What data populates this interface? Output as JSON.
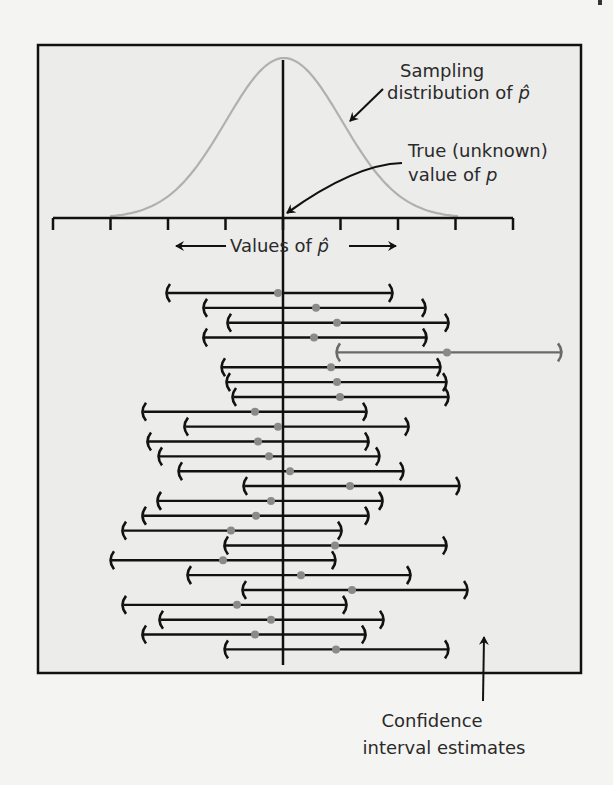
{
  "labels": {
    "sampling_line1": "Sampling",
    "sampling_line2": "distribution of ",
    "phat_symbol": "p̂",
    "true_line1": "True (unknown)",
    "true_line2": "value of ",
    "p_symbol": "p",
    "axis_label": "Values of ",
    "ci_line1": "Confidence",
    "ci_line2": "interval estimates"
  },
  "colors": {
    "frame_bg": "#ececea",
    "page_bg": "#f4f4f2",
    "ink": "#111111",
    "curve": "#b0b0b0",
    "dot": "#8a8a8a",
    "missed_interval": "#6a6a6a"
  },
  "chart_data": {
    "type": "diagram",
    "title": "",
    "axis": {
      "label": "Values of p̂",
      "ticks": 9,
      "true_value_tick_index": 4
    },
    "true_value_x": 283,
    "intervals": [
      {
        "left": 166,
        "right": 393,
        "center": 278,
        "captures": true
      },
      {
        "left": 203,
        "right": 426,
        "center": 316,
        "captures": true
      },
      {
        "left": 227,
        "right": 449,
        "center": 337,
        "captures": true
      },
      {
        "left": 203,
        "right": 427,
        "center": 314,
        "captures": true
      },
      {
        "left": 336,
        "right": 562,
        "center": 447,
        "captures": false
      },
      {
        "left": 221,
        "right": 441,
        "center": 331,
        "captures": true
      },
      {
        "left": 226,
        "right": 447,
        "center": 337,
        "captures": true
      },
      {
        "left": 232,
        "right": 449,
        "center": 340,
        "captures": true
      },
      {
        "left": 142,
        "right": 367,
        "center": 255,
        "captures": true
      },
      {
        "left": 184,
        "right": 409,
        "center": 278,
        "captures": true
      },
      {
        "left": 147,
        "right": 369,
        "center": 258,
        "captures": true
      },
      {
        "left": 158,
        "right": 380,
        "center": 269,
        "captures": true
      },
      {
        "left": 178,
        "right": 404,
        "center": 290,
        "captures": true
      },
      {
        "left": 243,
        "right": 460,
        "center": 350,
        "captures": true
      },
      {
        "left": 157,
        "right": 383,
        "center": 271,
        "captures": true
      },
      {
        "left": 142,
        "right": 369,
        "center": 256,
        "captures": true
      },
      {
        "left": 122,
        "right": 342,
        "center": 231,
        "captures": true
      },
      {
        "left": 224,
        "right": 447,
        "center": 335,
        "captures": true
      },
      {
        "left": 110,
        "right": 336,
        "center": 223,
        "captures": true
      },
      {
        "left": 187,
        "right": 411,
        "center": 301,
        "captures": true
      },
      {
        "left": 242,
        "right": 468,
        "center": 352,
        "captures": true
      },
      {
        "left": 122,
        "right": 347,
        "center": 237,
        "captures": true
      },
      {
        "left": 159,
        "right": 384,
        "center": 271,
        "captures": true
      },
      {
        "left": 142,
        "right": 366,
        "center": 255,
        "captures": true
      },
      {
        "left": 224,
        "right": 449,
        "center": 336,
        "captures": true
      }
    ],
    "annotations": [
      "Sampling distribution of p̂",
      "True (unknown) value of p",
      "Values of p̂",
      "Confidence interval estimates"
    ]
  }
}
